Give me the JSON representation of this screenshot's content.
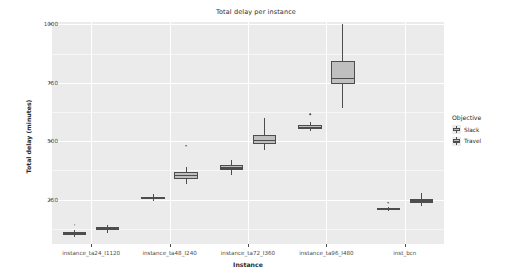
{
  "chart_data": {
    "type": "box",
    "title": "Total delay per instance",
    "xlabel": "Instance",
    "ylabel": "Total delay (minutes)",
    "ylim": [
      60,
      1010
    ],
    "yticks": [
      250,
      500,
      750,
      1000
    ],
    "ytick_labels": [
      "250",
      "500",
      "750",
      "1000"
    ],
    "grid": true,
    "legend": {
      "title": "Objective",
      "position": "right",
      "entries": [
        {
          "label": "Slack",
          "fill": "#bfbfbf",
          "stroke": "#4d4d4d"
        },
        {
          "label": "Travel",
          "fill": "#bfbfbf",
          "stroke": "#4d4d4d"
        }
      ]
    },
    "categories": [
      "instance_ta24_I1120",
      "instance_ta48_I240",
      "instance_ta72_I360",
      "instance_ta96_I480",
      "inst_bcn"
    ],
    "series": [
      {
        "name": "Slack",
        "boxes": [
          {
            "category": "instance_ta24_I1120",
            "min": 92,
            "q1": 100,
            "median": 106,
            "q3": 112,
            "max": 120,
            "outliers": [
              143
            ]
          },
          {
            "category": "instance_ta48_I240",
            "min": 243,
            "q1": 251,
            "median": 256,
            "q3": 262,
            "max": 276,
            "outliers": []
          },
          {
            "category": "instance_ta72_I360",
            "min": 356,
            "q1": 375,
            "median": 385,
            "q3": 396,
            "max": 420,
            "outliers": []
          },
          {
            "category": "instance_ta96_I480",
            "min": 545,
            "q1": 553,
            "median": 560,
            "q3": 569,
            "max": 580,
            "outliers": [
              615
            ]
          },
          {
            "category": "inst_bcn",
            "min": 200,
            "q1": 206,
            "median": 210,
            "q3": 214,
            "max": 220,
            "outliers": [
              237
            ]
          }
        ]
      },
      {
        "name": "Travel",
        "boxes": [
          {
            "category": "instance_ta24_I1120",
            "min": 108,
            "q1": 118,
            "median": 126,
            "q3": 134,
            "max": 142,
            "outliers": []
          },
          {
            "category": "instance_ta48_I240",
            "min": 316,
            "q1": 338,
            "median": 352,
            "q3": 368,
            "max": 390,
            "outliers": [
              480
            ]
          },
          {
            "category": "instance_ta72_I360",
            "min": 462,
            "q1": 486,
            "median": 503,
            "q3": 528,
            "max": 600,
            "outliers": []
          },
          {
            "category": "instance_ta96_I480",
            "min": 640,
            "q1": 744,
            "median": 768,
            "q3": 845,
            "max": 1000,
            "outliers": []
          },
          {
            "category": "inst_bcn",
            "min": 222,
            "q1": 236,
            "median": 244,
            "q3": 253,
            "max": 278,
            "outliers": []
          }
        ]
      }
    ]
  }
}
